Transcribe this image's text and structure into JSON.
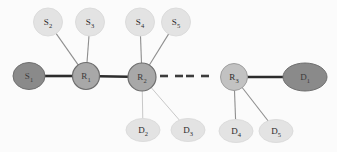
{
  "diagram": {
    "background_color": "#fbfbfb",
    "palette": {
      "endpoint_fill": "#8a8a8a",
      "endpoint_stroke": "#6f6f6f",
      "router_fill": "#a8a8a8",
      "router_stroke": "#6e6e6e",
      "router_light_fill": "#c2c2c2",
      "router_light_stroke": "#9e9e9e",
      "leaf_fill": "#e3e3e3",
      "leaf_stroke": "#dcdcdc",
      "backbone_edge": "#2c2c2c",
      "thin_edge": "#8e8e8e",
      "faint_edge": "#c8c8c8",
      "dash_color": "#3c3c3c",
      "label_color": "#2b2b2b"
    },
    "nodes": [
      {
        "id": "S1",
        "base": "S",
        "sub": "1",
        "cx": 29,
        "cy": 76,
        "rx": 16,
        "ry": 13.5,
        "kind": "endpoint"
      },
      {
        "id": "R1",
        "base": "R",
        "sub": "1",
        "cx": 86,
        "cy": 76,
        "rx": 13.5,
        "ry": 13.5,
        "kind": "router"
      },
      {
        "id": "R2",
        "base": "R",
        "sub": "2",
        "cx": 142,
        "cy": 77,
        "rx": 14,
        "ry": 14,
        "kind": "router"
      },
      {
        "id": "R3",
        "base": "R",
        "sub": "3",
        "cx": 234,
        "cy": 77,
        "rx": 13.5,
        "ry": 13.5,
        "kind": "router-light"
      },
      {
        "id": "D1",
        "base": "D",
        "sub": "1",
        "cx": 305,
        "cy": 77,
        "rx": 22,
        "ry": 14,
        "kind": "endpoint"
      },
      {
        "id": "S2",
        "base": "S",
        "sub": "2",
        "cx": 48,
        "cy": 22,
        "rx": 14.5,
        "ry": 14,
        "kind": "leaf"
      },
      {
        "id": "S3",
        "base": "S",
        "sub": "3",
        "cx": 90,
        "cy": 22,
        "rx": 14.5,
        "ry": 14,
        "kind": "leaf"
      },
      {
        "id": "S4",
        "base": "S",
        "sub": "4",
        "cx": 140,
        "cy": 22,
        "rx": 14.5,
        "ry": 14,
        "kind": "leaf"
      },
      {
        "id": "S5",
        "base": "S",
        "sub": "5",
        "cx": 176,
        "cy": 22,
        "rx": 14.5,
        "ry": 14,
        "kind": "leaf"
      },
      {
        "id": "D2",
        "base": "D",
        "sub": "2",
        "cx": 143,
        "cy": 130,
        "rx": 17,
        "ry": 11.5,
        "kind": "leaf"
      },
      {
        "id": "D3",
        "base": "D",
        "sub": "3",
        "cx": 188,
        "cy": 130,
        "rx": 17,
        "ry": 11.5,
        "kind": "leaf"
      },
      {
        "id": "D4",
        "base": "D",
        "sub": "4",
        "cx": 236,
        "cy": 131,
        "rx": 17,
        "ry": 11.5,
        "kind": "leaf"
      },
      {
        "id": "D5",
        "base": "D",
        "sub": "5",
        "cx": 276,
        "cy": 131,
        "rx": 17,
        "ry": 11.5,
        "kind": "leaf"
      }
    ],
    "edges": [
      {
        "from": "S1",
        "to": "R1",
        "style": "backbone"
      },
      {
        "from": "R1",
        "to": "R2",
        "style": "backbone"
      },
      {
        "from": "R3",
        "to": "D1",
        "style": "backbone"
      },
      {
        "from": "S2",
        "to": "R1",
        "style": "thin"
      },
      {
        "from": "S3",
        "to": "R1",
        "style": "thin"
      },
      {
        "from": "S4",
        "to": "R2",
        "style": "thin"
      },
      {
        "from": "S5",
        "to": "R2",
        "style": "thin"
      },
      {
        "from": "R2",
        "to": "D2",
        "style": "faint"
      },
      {
        "from": "R2",
        "to": "D3",
        "style": "faint"
      },
      {
        "from": "R3",
        "to": "D4",
        "style": "thin"
      },
      {
        "from": "R3",
        "to": "D5",
        "style": "thin"
      }
    ],
    "ellipsis": {
      "label": "- -- -",
      "segments": [
        {
          "x1": 160,
          "x2": 168,
          "y": 76
        },
        {
          "x1": 175,
          "x2": 183,
          "y": 76
        },
        {
          "x1": 186,
          "x2": 194,
          "y": 76
        },
        {
          "x1": 201,
          "x2": 209,
          "y": 76
        }
      ]
    }
  }
}
